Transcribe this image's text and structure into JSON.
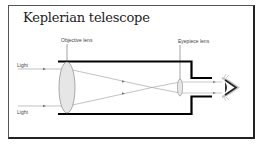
{
  "diagram": {
    "title": "Keplerian telescope",
    "labels": {
      "objective_lens": "Objective lens",
      "eyepiece_lens": "Eyepiece lens",
      "light_top": "Light",
      "light_bottom": "Light"
    },
    "colors": {
      "tube": "#000000",
      "lens_fill": "#e6e6e6",
      "lens_stroke": "#888888",
      "ray": "#999999",
      "frame": "#333333"
    }
  }
}
